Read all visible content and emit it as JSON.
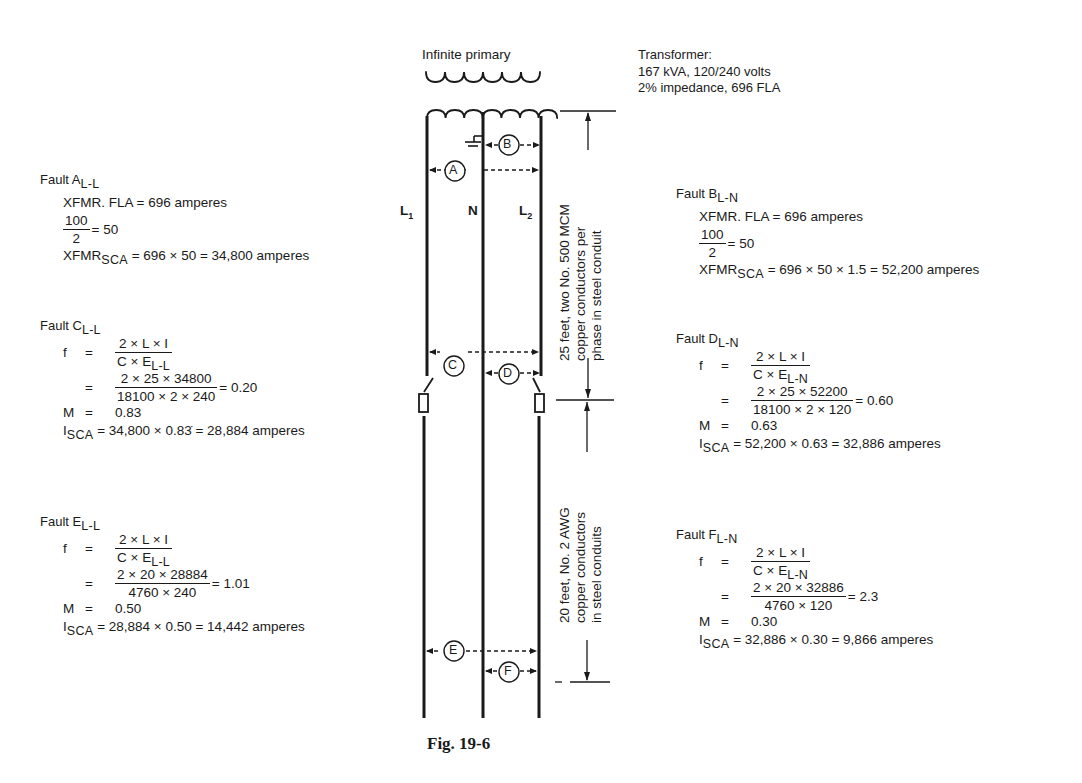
{
  "figure_caption": "Fig. 19-6",
  "diagram": {
    "primary_label": "Infinite primary",
    "transformer": {
      "title": "Transformer:",
      "line1": "167 kVA, 120/240 volts",
      "line2": "2% impedance, 696 FLA"
    },
    "conductors": {
      "l1": "L",
      "l1_sub": "1",
      "n": "N",
      "l2": "L",
      "l2_sub": "2"
    },
    "fault_points": [
      "A",
      "B",
      "C",
      "D",
      "E",
      "F"
    ],
    "segment1_label": [
      "25 feet, two No. 500 MCM",
      "copper conductors per",
      "phase in steel conduit"
    ],
    "segment2_label": [
      "20 feet, No. 2 AWG",
      "copper conductors",
      "in steel conduits"
    ]
  },
  "faults": {
    "A": {
      "title": "Fault A",
      "sub": "L-L",
      "fla": "XFMR. FLA = 696 amperes",
      "frac_num": "100",
      "frac_den": "2",
      "frac_result": "= 50",
      "sca_label": "XFMR",
      "sca_sub": "SCA",
      "sca_expr": "= 696 × 50 = 34,800 amperes"
    },
    "B": {
      "title": "Fault B",
      "sub": "L-N",
      "fla": "XFMR. FLA = 696 amperes",
      "frac_num": "100",
      "frac_den": "2",
      "frac_result": "= 50",
      "sca_label": "XFMR",
      "sca_sub": "SCA",
      "sca_expr": "= 696 × 50 × 1.5 = 52,200 amperes"
    },
    "C": {
      "title": "Fault C",
      "sub": "L-L",
      "f_label": "f",
      "eq": "=",
      "formula_num": "2 × L × I",
      "formula_den": "C × E",
      "formula_den_sub": "L-L",
      "calc_num": "2 × 25 × 34800",
      "calc_den": "18100 × 2 × 240",
      "calc_result": "= 0.20",
      "m_label": "M",
      "m_value": "0.83",
      "i_label": "I",
      "i_sub": "SCA",
      "i_expr": "= 34,800 × 0.83̇ = 28,884 amperes"
    },
    "D": {
      "title": "Fault D",
      "sub": "L-N",
      "f_label": "f",
      "eq": "=",
      "formula_num": "2 × L × I",
      "formula_den": "C × E",
      "formula_den_sub": "L-N",
      "calc_num": "2 × 25 × 52200",
      "calc_den": "18100 × 2 × 120",
      "calc_result": "= 0.60",
      "m_label": "M",
      "m_value": "0.63",
      "i_label": "I",
      "i_sub": "SCA",
      "i_expr": "= 52,200 × 0.63 = 32,886 amperes"
    },
    "E": {
      "title": "Fault E",
      "sub": "L-L",
      "f_label": "f",
      "eq": "=",
      "formula_num": "2 × L × I",
      "formula_den": "C × E",
      "formula_den_sub": "L-L",
      "calc_num": "2 × 20 × 28884",
      "calc_den": "4760 × 240",
      "calc_result": "= 1.01",
      "m_label": "M",
      "m_value": "0.50",
      "i_label": "I",
      "i_sub": "SCA",
      "i_expr": "= 28,884 × 0.50 = 14,442 amperes"
    },
    "F": {
      "title": "Fault F",
      "sub": "L-N",
      "f_label": "f",
      "eq": "=",
      "formula_num": "2 × L × I",
      "formula_den": "C × E",
      "formula_den_sub": "L-N",
      "calc_num": "2 × 20 × 32886",
      "calc_den": "4760 × 120",
      "calc_result": "= 2.3",
      "m_label": "M",
      "m_value": "0.30",
      "i_label": "I",
      "i_sub": "SCA",
      "i_expr": "= 32,886 × 0.30 = 9,866 amperes"
    }
  }
}
